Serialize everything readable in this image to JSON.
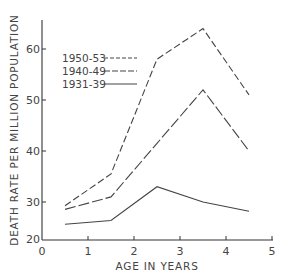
{
  "chart_data": {
    "type": "line",
    "title": "",
    "xlabel": "AGE IN YEARS",
    "ylabel": "DEATH RATE PER MILLION POPULATION",
    "xlim": [
      0,
      5
    ],
    "ylim": [
      20,
      65
    ],
    "x_ticks": [
      "0",
      "1",
      "2",
      "3",
      "4",
      "5"
    ],
    "y_ticks": [
      "20",
      "30",
      "40",
      "50",
      "60"
    ],
    "y_axis_break": "between 20 and 30",
    "grid": false,
    "legend_position": "top-left",
    "x": [
      0.5,
      1.5,
      2.5,
      3.5,
      4.5
    ],
    "series": [
      {
        "name": "1950-53",
        "style": "short-dash",
        "values": [
          29,
          35.5,
          58,
          64,
          51
        ]
      },
      {
        "name": "1940-49",
        "style": "long-dash",
        "values": [
          28,
          31,
          41.5,
          52,
          40
        ]
      },
      {
        "name": "1931-39",
        "style": "solid",
        "values": [
          24,
          25,
          33,
          30,
          27.5
        ]
      }
    ]
  }
}
